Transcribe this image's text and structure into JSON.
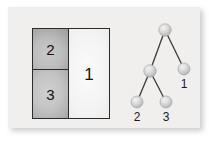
{
  "figure": {
    "caption": "",
    "panel_color": "#f0efee",
    "background_color": "#ffffff"
  },
  "partition_diagram": {
    "name": "partitioned rectangle",
    "outline_color": "#2c2c2c",
    "cells": [
      {
        "id": "cell-two",
        "label": "2",
        "position": "top-left",
        "fill": "gray-gradient",
        "fill_color": "#a6a6a6"
      },
      {
        "id": "cell-three",
        "label": "3",
        "position": "bottom-left",
        "fill": "gray-gradient",
        "fill_color": "#ababab"
      },
      {
        "id": "cell-one",
        "label": "1",
        "position": "right",
        "fill": "light-gradient",
        "fill_color": "#e6e6e6"
      }
    ]
  },
  "tree_diagram": {
    "name": "binary tree",
    "node_color": "#d0d0d0",
    "edge_color": "#3a3a3a",
    "nodes": [
      {
        "id": "root",
        "label": "",
        "x": 47,
        "y": 13
      },
      {
        "id": "internal",
        "label": "",
        "x": 32,
        "y": 54
      },
      {
        "id": "leaf-one",
        "label": "1",
        "x": 66,
        "y": 52
      },
      {
        "id": "leaf-two",
        "label": "2",
        "x": 19,
        "y": 85
      },
      {
        "id": "leaf-three",
        "label": "3",
        "x": 48,
        "y": 85
      }
    ],
    "edges": [
      {
        "from": "root",
        "to": "internal"
      },
      {
        "from": "root",
        "to": "leaf-one"
      },
      {
        "from": "internal",
        "to": "leaf-two"
      },
      {
        "from": "internal",
        "to": "leaf-three"
      }
    ],
    "labels": [
      {
        "for": "leaf-one",
        "text": "1",
        "x": 66,
        "y": 70
      },
      {
        "for": "leaf-two",
        "text": "2",
        "x": 19,
        "y": 103
      },
      {
        "for": "leaf-three",
        "text": "3",
        "x": 48,
        "y": 103
      }
    ]
  }
}
